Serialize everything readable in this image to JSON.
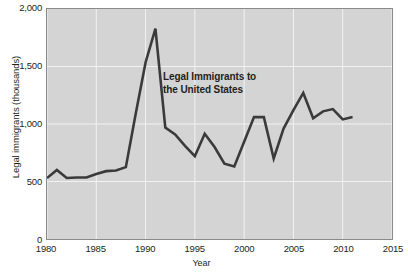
{
  "chart_data": {
    "type": "line",
    "title": "",
    "annotation": "Legal Immigrants to\nthe United States",
    "xlabel": "Year",
    "ylabel": "Legal immigrants (thousands)",
    "xlim": [
      1980,
      2015
    ],
    "ylim": [
      0,
      2000
    ],
    "grid": true,
    "legend_position": "none",
    "line_color": "#3a3a3a",
    "plot_background": "#d4d4d4",
    "gridline_color": "#f2f2f2",
    "frame_color": "#8a8a8a",
    "x_ticks": [
      1980,
      1985,
      1990,
      1995,
      2000,
      2005,
      2010,
      2015
    ],
    "x_tick_labels": [
      "1980",
      "1985",
      "1990",
      "1995",
      "2000",
      "2005",
      "2010",
      "2015"
    ],
    "y_ticks": [
      0,
      500,
      1000,
      1500,
      2000
    ],
    "y_tick_labels": [
      "0",
      "500",
      "1,000",
      "1,500",
      "2,000"
    ],
    "x": [
      1980,
      1981,
      1982,
      1983,
      1984,
      1985,
      1986,
      1987,
      1988,
      1989,
      1990,
      1991,
      1992,
      1993,
      1994,
      1995,
      1996,
      1997,
      1998,
      1999,
      2000,
      2001,
      2002,
      2003,
      2004,
      2005,
      2006,
      2007,
      2008,
      2009,
      2010,
      2011
    ],
    "values": [
      530,
      600,
      530,
      535,
      535,
      565,
      590,
      595,
      625,
      1090,
      1535,
      1830,
      970,
      910,
      810,
      720,
      915,
      800,
      655,
      630,
      845,
      1060,
      1060,
      700,
      960,
      1120,
      1270,
      1050,
      1110,
      1130,
      1040,
      1060
    ],
    "series": [
      {
        "name": "Legal Immigrants to the United States",
        "values": [
          530,
          600,
          530,
          535,
          535,
          565,
          590,
          595,
          625,
          1090,
          1535,
          1830,
          970,
          910,
          810,
          720,
          915,
          800,
          655,
          630,
          845,
          1060,
          1060,
          700,
          960,
          1120,
          1270,
          1050,
          1110,
          1130,
          1040,
          1060
        ]
      }
    ]
  }
}
